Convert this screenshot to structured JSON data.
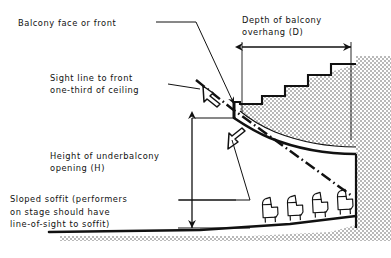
{
  "diagram": {
    "labels": {
      "balcony_face": "Balcony face or front",
      "sight_line_l1": "Sight line to front",
      "sight_line_l2": "one-third of ceiling",
      "depth_l1": "Depth of balcony",
      "depth_l2": "overhang (D)",
      "height_l1": "Height of underbalcony",
      "height_l2": "opening (H)",
      "soffit_l1": "Sloped soffit (performers",
      "soffit_l2": "on stage should have",
      "soffit_l3": "line-of-sight to soffit)"
    },
    "dimensions": {
      "depth_symbol": "D",
      "height_symbol": "H"
    },
    "colors": {
      "ink": "#111111",
      "paper": "#ffffff",
      "hatch": "#8a8a8a",
      "hatch_fill": "#d8d8d8"
    },
    "elements": {
      "seat_count": 4,
      "balcony_step_count": 5,
      "sight_line_style": "dash-dot",
      "hatch_style": "stipple-dot"
    }
  }
}
